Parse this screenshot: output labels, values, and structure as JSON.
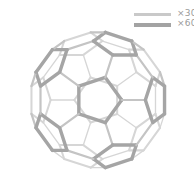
{
  "diagram": {
    "title": "",
    "center": [
      98,
      100
    ],
    "radius": 69,
    "rotation_deg": {
      "x": 0,
      "y": 0,
      "z": 0
    },
    "colors": {
      "single_bond": "#c4c4c4",
      "double_bond": "#a5a5a5",
      "background": "#ffffff"
    },
    "stroke_widths": {
      "single_bond": 2.2,
      "double_bond": 3.4
    }
  },
  "legend": {
    "items": [
      {
        "label": "×30",
        "color": "#c9c9c9",
        "thickness": 3,
        "meaning": "double bonds"
      },
      {
        "label": "×60",
        "color": "#a3a3a3",
        "thickness": 4,
        "meaning": "single bonds"
      }
    ]
  }
}
